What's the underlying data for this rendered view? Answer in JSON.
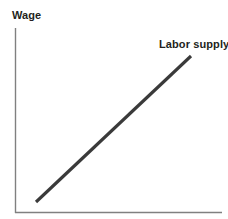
{
  "chart_data": {
    "type": "line",
    "title": "",
    "subtitle": "",
    "xlabel": "",
    "ylabel": "Wage",
    "xlim": [
      0,
      100
    ],
    "ylim": [
      0,
      100
    ],
    "grid": false,
    "legend_position": "inline-end-of-line",
    "axes": {
      "y_axis_label": "Wage",
      "x_axis_label": "",
      "show_ticks": false,
      "show_tick_labels": false,
      "axis_color": "#808080"
    },
    "series": [
      {
        "name": "Labor supply",
        "label": "Labor supply",
        "color": "#3a3a3a",
        "line_width": 3,
        "x": [
          12,
          96
        ],
        "y": [
          6,
          85
        ],
        "annotation": "Labor supply"
      }
    ],
    "annotations": [
      {
        "text": "Wage",
        "role": "y-axis-title"
      },
      {
        "text": "Labor supply",
        "role": "series-label"
      }
    ]
  },
  "geometry": {
    "y_axis": {
      "x": 15.5,
      "y_top": 28,
      "y_bottom": 213
    },
    "x_axis": {
      "y": 212.5,
      "x_left": 15,
      "x_right": 222
    },
    "supply_line": {
      "x1": 36,
      "y1": 202,
      "x2": 191,
      "y2": 56
    }
  },
  "colors": {
    "background": "#ffffff",
    "axis": "#808080",
    "curve": "#3a3a3a",
    "text": "#231f20"
  }
}
